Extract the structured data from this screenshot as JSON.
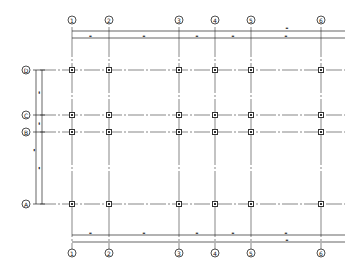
{
  "drawing": {
    "type": "structural-column-grid-plan",
    "colors": {
      "line": "#222222",
      "grid_line": "#555555",
      "column": "#333333",
      "background": "#ffffff"
    },
    "columns": [
      {
        "label": "1"
      },
      {
        "label": "2"
      },
      {
        "label": "3"
      },
      {
        "label": "4"
      },
      {
        "label": "5"
      },
      {
        "label": "6"
      }
    ],
    "rows": [
      {
        "label": "D"
      },
      {
        "label": "C"
      },
      {
        "label": "B"
      },
      {
        "label": "A"
      }
    ],
    "top_dimensions": {
      "segment_labels": [
        "▬",
        "▬",
        "▬",
        "▬",
        "▬"
      ],
      "overall_label": "▬"
    },
    "bottom_dimensions": {
      "segment_labels": [
        "▬",
        "▬",
        "▬",
        "▬",
        "▬"
      ],
      "overall_label": "▬"
    },
    "left_dimensions": {
      "segment_labels": [
        "▬",
        "▬",
        "▬"
      ],
      "overall_label": "▬"
    }
  }
}
